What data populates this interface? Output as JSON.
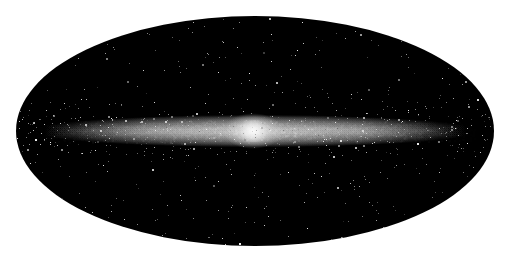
{
  "image": {
    "subject": "All-sky map of the Milky Way galaxy (edge-on disk with central bulge)",
    "projection": "elliptical (Mollweide-style) all-sky projection",
    "background_color": "#ffffff",
    "sky_color": "#000000",
    "band_color": "#e6e6e6",
    "bulge_color": "#f4f4f4",
    "ellipse": {
      "cx": 255,
      "cy": 131,
      "rx": 239,
      "ry": 115
    },
    "galactic_plane": {
      "cy": 131,
      "half_length": 225,
      "thickness": 14
    },
    "bulge": {
      "cx": 253,
      "cy": 131,
      "rx": 30,
      "ry": 18
    },
    "star_count": 900
  }
}
